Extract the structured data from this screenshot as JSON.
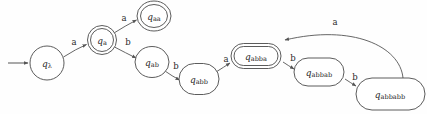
{
  "diagram": {
    "type": "finite-state-automaton",
    "background_color": "#fefefe",
    "stroke_color": "#555555",
    "text_color": "#2b2b2b",
    "alphabet": [
      "a",
      "b"
    ],
    "start_state": "q_lambda",
    "start_marker": "incoming arrow from left",
    "states": [
      {
        "id": "q_lambda",
        "name": "q",
        "subscript": "λ",
        "accepting": false,
        "shape": "circle",
        "cx": 47,
        "cy": 63,
        "rx": 17,
        "ry": 17
      },
      {
        "id": "q_a",
        "name": "q",
        "subscript": "a",
        "accepting": true,
        "shape": "circle",
        "cx": 102,
        "cy": 40,
        "rx": 14.5,
        "ry": 14.5
      },
      {
        "id": "q_aa",
        "name": "q",
        "subscript": "aa",
        "accepting": true,
        "shape": "circle",
        "cx": 154,
        "cy": 16,
        "rx": 17,
        "ry": 15
      },
      {
        "id": "q_ab",
        "name": "q",
        "subscript": "ab",
        "accepting": false,
        "shape": "circle",
        "cx": 152,
        "cy": 62,
        "rx": 17,
        "ry": 15.5
      },
      {
        "id": "q_abb",
        "name": "q",
        "subscript": "abb",
        "accepting": false,
        "shape": "rounded-rect",
        "cx": 199,
        "cy": 79,
        "rx": 20,
        "ry": 15.5
      },
      {
        "id": "q_abba",
        "name": "q",
        "subscript": "abba",
        "accepting": true,
        "shape": "rounded-rect",
        "cx": 256,
        "cy": 56,
        "rx": 25,
        "ry": 12.5
      },
      {
        "id": "q_abbab",
        "name": "q",
        "subscript": "abbab",
        "accepting": false,
        "shape": "rounded-rect",
        "cx": 319,
        "cy": 72,
        "rx": 25,
        "ry": 14
      },
      {
        "id": "q_abbabb",
        "name": "q",
        "subscript": "abbabb",
        "accepting": false,
        "shape": "rounded-rect",
        "cx": 390,
        "cy": 94,
        "rx": 35,
        "ry": 16
      }
    ],
    "transitions": [
      {
        "id": "t1",
        "from": "q_lambda",
        "to": "q_a",
        "label": "a",
        "label_x": 74,
        "label_y": 42
      },
      {
        "id": "t2",
        "from": "q_a",
        "to": "q_aa",
        "label": "a",
        "label_x": 124,
        "label_y": 18
      },
      {
        "id": "t3",
        "from": "q_a",
        "to": "q_ab",
        "label": "b",
        "label_x": 128,
        "label_y": 42
      },
      {
        "id": "t4",
        "from": "q_ab",
        "to": "q_abb",
        "label": "b",
        "label_x": 176,
        "label_y": 66
      },
      {
        "id": "t5",
        "from": "q_abb",
        "to": "q_abba",
        "label": "a",
        "label_x": 226,
        "label_y": 59
      },
      {
        "id": "t6",
        "from": "q_abba",
        "to": "q_abbab",
        "label": "b",
        "label_x": 293,
        "label_y": 58
      },
      {
        "id": "t7",
        "from": "q_abbab",
        "to": "q_abbabb",
        "label": "b",
        "label_x": 355,
        "label_y": 77
      },
      {
        "id": "t8",
        "from": "q_abbabb",
        "to": "q_abba",
        "label": "a",
        "label_x": 335,
        "label_y": 22
      }
    ]
  }
}
